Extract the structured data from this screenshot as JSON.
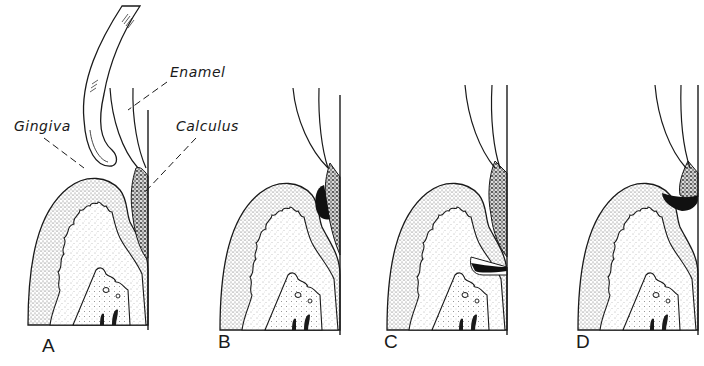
{
  "figure": {
    "colors": {
      "ink": "#1a1a1a",
      "background": "#ffffff",
      "stipple": "#555555",
      "calculus_dark": "#111111"
    },
    "annotations": [
      {
        "id": "enamel",
        "text": "Enamel"
      },
      {
        "id": "gingiva",
        "text": "Gingiva"
      },
      {
        "id": "calculus",
        "text": "Calculus"
      }
    ],
    "panels": [
      {
        "letter": "A",
        "description": "Instrument (curette) approaching gingival margin beside tooth with calculus"
      },
      {
        "letter": "B",
        "description": "Calculus deposit at gingival margin, dark area adjacent to tooth"
      },
      {
        "letter": "C",
        "description": "Deeper subgingival calculus with dark pocket area at base"
      },
      {
        "letter": "D",
        "description": "Calculus with dark deposit at gingival crest"
      }
    ]
  }
}
